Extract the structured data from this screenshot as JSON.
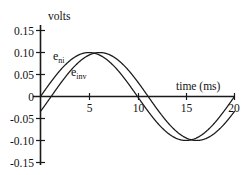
{
  "chart_data": {
    "type": "line",
    "title": "",
    "xlabel": "time  (ms)",
    "ylabel": "volts",
    "xlim": [
      0,
      20
    ],
    "ylim": [
      -0.15,
      0.15
    ],
    "xticks": [
      "0",
      "5",
      "10",
      "15",
      "20"
    ],
    "xtick_values": [
      0,
      5,
      10,
      15,
      20
    ],
    "yticks": [
      "0.15",
      "0.10",
      "0.05",
      "0",
      "-0.05",
      "-0.10",
      "-0.15"
    ],
    "ytick_values": [
      0.15,
      0.1,
      0.05,
      0,
      -0.05,
      -0.1,
      -0.15
    ],
    "grid": false,
    "legend_position": "inline-annotation",
    "series": [
      {
        "name": "e_ni",
        "label_base": "e",
        "label_sub": "ni",
        "amplitude": 0.1,
        "period_ms": 20,
        "phase_ms": 0,
        "x": [
          0,
          1,
          2,
          3,
          4,
          5,
          6,
          7,
          8,
          9,
          10,
          11,
          12,
          13,
          14,
          15,
          16,
          17,
          18,
          19,
          20
        ],
        "values": [
          0,
          0.031,
          0.059,
          0.081,
          0.095,
          0.1,
          0.095,
          0.081,
          0.059,
          0.031,
          0,
          -0.031,
          -0.059,
          -0.081,
          -0.095,
          -0.1,
          -0.095,
          -0.081,
          -0.059,
          -0.031,
          0
        ]
      },
      {
        "name": "e_inv",
        "label_base": "e",
        "label_sub": "inv",
        "amplitude": 0.1,
        "period_ms": 20,
        "phase_ms": 1.1,
        "x": [
          0,
          1,
          2,
          3,
          4,
          5,
          6,
          7,
          8,
          9,
          10,
          11,
          12,
          13,
          14,
          15,
          16,
          17,
          18,
          19,
          20
        ],
        "values": [
          -0.034,
          0,
          0.031,
          0.059,
          0.081,
          0.095,
          0.1,
          0.095,
          0.081,
          0.059,
          0.031,
          0,
          -0.031,
          -0.059,
          -0.081,
          -0.095,
          -0.1,
          -0.095,
          -0.081,
          -0.059,
          -0.034
        ]
      }
    ],
    "annotations": [
      {
        "name": "e-ni-label",
        "text": "e",
        "sub": "ni"
      },
      {
        "name": "e-inv-label",
        "text": "e",
        "sub": "inv"
      }
    ]
  },
  "axes": {
    "y_title": "volts",
    "x_title": "time  (ms)"
  },
  "colors": {
    "ink": "#1a1a1a",
    "background": "#ffffff"
  }
}
